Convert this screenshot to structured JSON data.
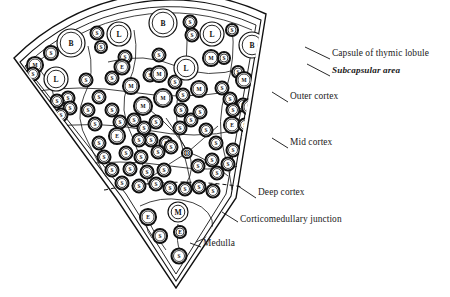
{
  "figure": {
    "kind": "histology-schematic",
    "background_color": "#ffffff",
    "ink_color": "#111111"
  },
  "annotations": [
    {
      "id": "capsule",
      "text": "Capsule of thymic lobule",
      "style": "regular",
      "x": 332,
      "y": 55,
      "leader": [
        [
          330,
          59
        ],
        [
          305,
          47
        ]
      ]
    },
    {
      "id": "subcapsular",
      "text": "Subcapsular area",
      "style": "bold-italic",
      "x": 332,
      "y": 72,
      "leader": [
        [
          330,
          76
        ],
        [
          307,
          64
        ]
      ]
    },
    {
      "id": "outer-cortex",
      "text": "Outer cortex",
      "style": "regular",
      "x": 290,
      "y": 98,
      "leader": [
        [
          288,
          102
        ],
        [
          272,
          92
        ]
      ]
    },
    {
      "id": "mid-cortex",
      "text": "Mid cortex",
      "style": "regular",
      "x": 290,
      "y": 144,
      "leader": [
        [
          288,
          148
        ],
        [
          272,
          138
        ]
      ]
    },
    {
      "id": "deep-cortex",
      "text": "Deep cortex",
      "style": "regular",
      "x": 258,
      "y": 194,
      "leader": [
        [
          256,
          198
        ],
        [
          238,
          186
        ]
      ]
    },
    {
      "id": "cmj",
      "text": "Corticomedullary junction",
      "style": "regular",
      "x": 240,
      "y": 221,
      "leader": [
        [
          238,
          222
        ],
        [
          222,
          212
        ]
      ]
    },
    {
      "id": "medulla",
      "text": "Medulla",
      "style": "regular",
      "x": 203,
      "y": 245,
      "leader": [
        [
          201,
          247
        ],
        [
          190,
          243
        ]
      ]
    }
  ],
  "cell_legend": [
    {
      "code": "S",
      "meaning": "small lymphocyte"
    },
    {
      "code": "M",
      "meaning": "macrophage / medium lymphocyte"
    },
    {
      "code": "L",
      "meaning": "large lymphocyte"
    },
    {
      "code": "B",
      "meaning": "lymphoblast"
    },
    {
      "code": "E",
      "meaning": "epithelial reticular cell"
    },
    {
      "code": "D",
      "meaning": "dividing cell"
    }
  ],
  "cells": [
    {
      "code": "B",
      "x": 71,
      "y": 43,
      "r": 14
    },
    {
      "code": "S",
      "x": 51,
      "y": 53,
      "r": 7
    },
    {
      "code": "M",
      "x": 35,
      "y": 65,
      "r": 8
    },
    {
      "code": "S",
      "x": 97,
      "y": 33,
      "r": 6.5
    },
    {
      "code": "L",
      "x": 119,
      "y": 34,
      "r": 12
    },
    {
      "code": "S",
      "x": 101,
      "y": 47,
      "r": 6
    },
    {
      "code": "S",
      "x": 125,
      "y": 57,
      "r": 6.5
    },
    {
      "code": "E",
      "x": 122,
      "y": 67,
      "r": 7.5
    },
    {
      "code": "B",
      "x": 163,
      "y": 23,
      "r": 14
    },
    {
      "code": "S",
      "x": 190,
      "y": 22,
      "r": 6.5
    },
    {
      "code": "S",
      "x": 192,
      "y": 35,
      "r": 6.5
    },
    {
      "code": "L",
      "x": 212,
      "y": 34,
      "r": 12
    },
    {
      "code": "S",
      "x": 159,
      "y": 55,
      "r": 6.5
    },
    {
      "code": "S",
      "x": 232,
      "y": 30,
      "r": 6
    },
    {
      "code": "B",
      "x": 252,
      "y": 45,
      "r": 13
    },
    {
      "code": "S",
      "x": 277,
      "y": 45,
      "r": 6.5
    },
    {
      "code": "M",
      "x": 292,
      "y": 59,
      "r": 8
    },
    {
      "code": "S",
      "x": 273,
      "y": 62,
      "r": 6.5
    },
    {
      "code": "L",
      "x": 56,
      "y": 79,
      "r": 12
    },
    {
      "code": "S",
      "x": 33,
      "y": 74,
      "r": 6.5
    },
    {
      "code": "S",
      "x": 86,
      "y": 80,
      "r": 6.5
    },
    {
      "code": "S",
      "x": 112,
      "y": 78,
      "r": 6.5
    },
    {
      "code": "M",
      "x": 131,
      "y": 86,
      "r": 8
    },
    {
      "code": "S",
      "x": 150,
      "y": 75,
      "r": 6.5
    },
    {
      "code": "M",
      "x": 159,
      "y": 74,
      "r": 8
    },
    {
      "code": "S",
      "x": 175,
      "y": 82,
      "r": 6.5
    },
    {
      "code": "L",
      "x": 186,
      "y": 68,
      "r": 12
    },
    {
      "code": "M",
      "x": 211,
      "y": 58,
      "r": 8
    },
    {
      "code": "S",
      "x": 224,
      "y": 58,
      "r": 6
    },
    {
      "code": "S",
      "x": 238,
      "y": 72,
      "r": 6
    },
    {
      "code": "M",
      "x": 244,
      "y": 80,
      "r": 8
    },
    {
      "code": "L",
      "x": 267,
      "y": 82,
      "r": 12
    },
    {
      "code": "S",
      "x": 286,
      "y": 80,
      "r": 6.5
    },
    {
      "code": "S",
      "x": 68,
      "y": 98,
      "r": 6.5
    },
    {
      "code": "S",
      "x": 70,
      "y": 108,
      "r": 6.5
    },
    {
      "code": "S",
      "x": 57,
      "y": 101,
      "r": 6.5
    },
    {
      "code": "S",
      "x": 61,
      "y": 115,
      "r": 6.5
    },
    {
      "code": "S",
      "x": 99,
      "y": 97,
      "r": 6.5
    },
    {
      "code": "M",
      "x": 143,
      "y": 106,
      "r": 9
    },
    {
      "code": "M",
      "x": 163,
      "y": 98,
      "r": 9
    },
    {
      "code": "S",
      "x": 183,
      "y": 95,
      "r": 6.5
    },
    {
      "code": "M",
      "x": 199,
      "y": 89,
      "r": 8
    },
    {
      "code": "S",
      "x": 222,
      "y": 88,
      "r": 6.5
    },
    {
      "code": "S",
      "x": 230,
      "y": 99,
      "r": 6.5
    },
    {
      "code": "S",
      "x": 243,
      "y": 105,
      "r": 6.5
    },
    {
      "code": "M",
      "x": 250,
      "y": 107,
      "r": 8
    },
    {
      "code": "S",
      "x": 266,
      "y": 107,
      "r": 6.5
    },
    {
      "code": "E",
      "x": 232,
      "y": 125,
      "r": 8
    },
    {
      "code": "S",
      "x": 88,
      "y": 110,
      "r": 6.5
    },
    {
      "code": "S",
      "x": 112,
      "y": 110,
      "r": 6.5
    },
    {
      "code": "S",
      "x": 120,
      "y": 122,
      "r": 6.5
    },
    {
      "code": "E",
      "x": 117,
      "y": 136,
      "r": 8
    },
    {
      "code": "S",
      "x": 95,
      "y": 124,
      "r": 6.5
    },
    {
      "code": "S",
      "x": 99,
      "y": 143,
      "r": 6.5
    },
    {
      "code": "S",
      "x": 134,
      "y": 120,
      "r": 6.5
    },
    {
      "code": "S",
      "x": 144,
      "y": 128,
      "r": 6.5
    },
    {
      "code": "S",
      "x": 156,
      "y": 122,
      "r": 6.5
    },
    {
      "code": "S",
      "x": 151,
      "y": 140,
      "r": 6.5
    },
    {
      "code": "S",
      "x": 139,
      "y": 140,
      "r": 6.5
    },
    {
      "code": "S",
      "x": 166,
      "y": 143,
      "r": 6.5
    },
    {
      "code": "S",
      "x": 181,
      "y": 110,
      "r": 6.5
    },
    {
      "code": "S",
      "x": 191,
      "y": 120,
      "r": 6.5
    },
    {
      "code": "S",
      "x": 200,
      "y": 112,
      "r": 6.5
    },
    {
      "code": "S",
      "x": 180,
      "y": 128,
      "r": 6.5
    },
    {
      "code": "S",
      "x": 206,
      "y": 130,
      "r": 6.5
    },
    {
      "code": "S",
      "x": 216,
      "y": 143,
      "r": 6.5
    },
    {
      "code": "S",
      "x": 233,
      "y": 150,
      "r": 6.5
    },
    {
      "code": "S",
      "x": 245,
      "y": 125,
      "r": 6.5
    },
    {
      "code": "S",
      "x": 249,
      "y": 139,
      "r": 6.5
    },
    {
      "code": "S",
      "x": 233,
      "y": 110,
      "r": 6.5
    },
    {
      "code": "D",
      "x": 187,
      "y": 153,
      "r": 5
    },
    {
      "code": "S",
      "x": 104,
      "y": 157,
      "r": 6.5
    },
    {
      "code": "S",
      "x": 126,
      "y": 153,
      "r": 6.5
    },
    {
      "code": "S",
      "x": 141,
      "y": 157,
      "r": 6.5
    },
    {
      "code": "S",
      "x": 158,
      "y": 152,
      "r": 6.5
    },
    {
      "code": "S",
      "x": 171,
      "y": 147,
      "r": 6.5
    },
    {
      "code": "S",
      "x": 112,
      "y": 170,
      "r": 6.5
    },
    {
      "code": "S",
      "x": 130,
      "y": 169,
      "r": 6.5
    },
    {
      "code": "S",
      "x": 147,
      "y": 172,
      "r": 6.5
    },
    {
      "code": "S",
      "x": 164,
      "y": 170,
      "r": 6.5
    },
    {
      "code": "S",
      "x": 198,
      "y": 166,
      "r": 6.5
    },
    {
      "code": "S",
      "x": 212,
      "y": 160,
      "r": 6.5
    },
    {
      "code": "S",
      "x": 217,
      "y": 173,
      "r": 6.5
    },
    {
      "code": "S",
      "x": 228,
      "y": 164,
      "r": 6.5
    },
    {
      "code": "S",
      "x": 122,
      "y": 183,
      "r": 6.5
    },
    {
      "code": "S",
      "x": 139,
      "y": 186,
      "r": 6.5
    },
    {
      "code": "S",
      "x": 156,
      "y": 184,
      "r": 6.5
    },
    {
      "code": "S",
      "x": 170,
      "y": 188,
      "r": 6.5
    },
    {
      "code": "S",
      "x": 185,
      "y": 189,
      "r": 6.5
    },
    {
      "code": "S",
      "x": 199,
      "y": 187,
      "r": 6.5
    },
    {
      "code": "S",
      "x": 213,
      "y": 191,
      "r": 6.5
    },
    {
      "code": "E",
      "x": 148,
      "y": 217,
      "r": 8
    },
    {
      "code": "M",
      "x": 178,
      "y": 212,
      "r": 10
    },
    {
      "code": "E",
      "x": 180,
      "y": 232,
      "r": 6
    },
    {
      "code": "S",
      "x": 160,
      "y": 236,
      "r": 7
    },
    {
      "code": "S",
      "x": 179,
      "y": 256,
      "r": 7.5
    }
  ]
}
